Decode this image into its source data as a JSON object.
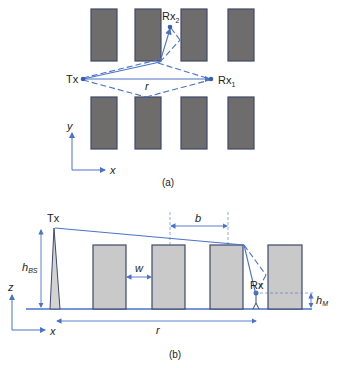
{
  "panel_a": {
    "caption": "(a)",
    "tx_label": "Tx",
    "rx1_label": "Rx",
    "rx1_sub": "1",
    "rx2_label": "Rx",
    "rx2_sub": "2",
    "distance_label": "r",
    "axis_x": "x",
    "axis_y": "y"
  },
  "panel_b": {
    "caption": "(b)",
    "tx_label": "Tx",
    "rx_label": "Rx",
    "hbs_label": "h",
    "hbs_sub": "BS",
    "hm_label": "h",
    "hm_sub": "M",
    "width_label": "w",
    "spacing_label": "b",
    "distance_label": "r",
    "axis_x": "x",
    "axis_z": "z"
  },
  "colors": {
    "ray": "#4a73c8",
    "building_top": "#6f6d6b",
    "building_side": "#c9c9c9"
  }
}
